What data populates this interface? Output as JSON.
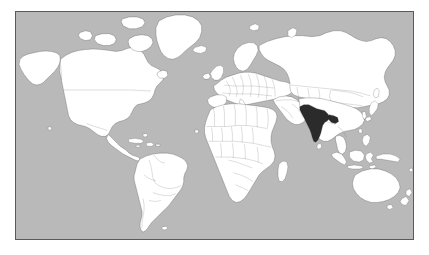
{
  "figure": {
    "type": "world-map",
    "projection": "mercator",
    "title": "",
    "caption": "",
    "frame_visible": true
  },
  "map": {
    "background_label": "ocean",
    "ocean_color": "#b9b9b9",
    "land_color": "#ffffff",
    "border_color": "#3a3a3a",
    "frame_color": "#5a5a5a",
    "page_color": "#ffffff",
    "highlight_color": "#2b2b2b",
    "highlighted_country": "India",
    "highlight_label": "India",
    "regions": [
      {
        "name": "North America",
        "label": "North America"
      },
      {
        "name": "Greenland",
        "label": "Greenland"
      },
      {
        "name": "South America",
        "label": "South America"
      },
      {
        "name": "Europe",
        "label": "Europe"
      },
      {
        "name": "Africa",
        "label": "Africa"
      },
      {
        "name": "Asia",
        "label": "Asia"
      },
      {
        "name": "Australia",
        "label": "Australia"
      },
      {
        "name": "New Zealand",
        "label": "New Zealand"
      },
      {
        "name": "Indonesia",
        "label": "Indonesia"
      },
      {
        "name": "Japan",
        "label": "Japan"
      },
      {
        "name": "Madagascar",
        "label": "Madagascar"
      },
      {
        "name": "Iceland",
        "label": "Iceland"
      },
      {
        "name": "United Kingdom",
        "label": "United Kingdom"
      },
      {
        "name": "Sri Lanka",
        "label": "Sri Lanka"
      },
      {
        "name": "Philippines",
        "label": "Philippines"
      },
      {
        "name": "Papua New Guinea",
        "label": "Papua New Guinea"
      }
    ],
    "internal_borders_shown": true,
    "antarctica_shown": false,
    "graticule_shown": false,
    "legend_shown": false,
    "labels_shown": false
  }
}
